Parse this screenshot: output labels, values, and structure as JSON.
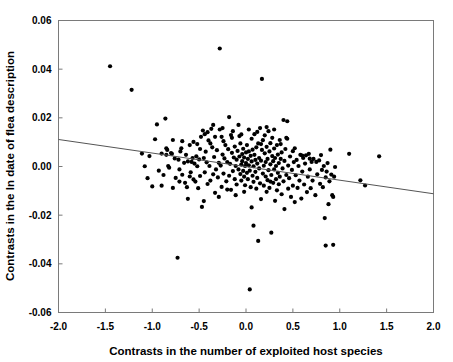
{
  "chart_data": {
    "type": "scatter",
    "title": "",
    "xlabel": "Contrasts in the number of exploited host species",
    "ylabel": "Contrasts in the ln date of flea description",
    "xlim": [
      -2.0,
      2.0
    ],
    "ylim": [
      -0.06,
      0.06
    ],
    "xticks": [
      -2.0,
      -1.5,
      -1.0,
      -0.5,
      0.0,
      0.5,
      1.0,
      1.5,
      2.0
    ],
    "yticks": [
      -0.06,
      -0.04,
      -0.02,
      0.0,
      0.02,
      0.04,
      0.06
    ],
    "xtick_labels": [
      "-2.0",
      "-1.5",
      "-1.0",
      "-0.5",
      "0.0",
      "0.5",
      "1.0",
      "1.5",
      "2.0"
    ],
    "ytick_labels": [
      "-0.06",
      "-0.04",
      "-0.02",
      "0.00",
      "0.02",
      "0.04",
      "0.06"
    ],
    "grid": false,
    "legend": false,
    "marker": "filled-circle",
    "marker_color": "#000000",
    "marker_size": 4.2,
    "frame_color": "#7a7a7a",
    "trendline": {
      "type": "linear",
      "color": "#555555",
      "x_start": -2.0,
      "y_start": 0.0111,
      "x_end": 2.0,
      "y_end": -0.0112,
      "slope": -0.005575,
      "intercept": -5e-05
    },
    "points": [
      [
        -1.45,
        0.0412
      ],
      [
        -1.22,
        0.0315
      ],
      [
        -1.11,
        0.0053
      ],
      [
        -1.08,
        0.0001
      ],
      [
        -1.05,
        -0.0048
      ],
      [
        -1.03,
        0.0043
      ],
      [
        -1.0,
        -0.0082
      ],
      [
        -0.97,
        0.0112
      ],
      [
        -0.95,
        0.0173
      ],
      [
        -0.93,
        -0.0017
      ],
      [
        -0.9,
        0.0053
      ],
      [
        -0.88,
        -0.0035
      ],
      [
        -0.86,
        0.0197
      ],
      [
        -0.85,
        0.0075
      ],
      [
        -0.84,
        0.0068
      ],
      [
        -0.83,
        0.0002
      ],
      [
        -0.82,
        -0.0005
      ],
      [
        -0.8,
        0.0055
      ],
      [
        -0.79,
        0.0052
      ],
      [
        -0.78,
        -0.0088
      ],
      [
        -0.76,
        0.0033
      ],
      [
        -0.75,
        -0.0047
      ],
      [
        -0.73,
        -0.0375
      ],
      [
        -0.72,
        0.0028
      ],
      [
        -0.71,
        -0.0012
      ],
      [
        -0.7,
        0.0062
      ],
      [
        -0.69,
        0.0075
      ],
      [
        -0.68,
        -0.0034
      ],
      [
        -0.66,
        0.0015
      ],
      [
        -0.65,
        -0.0067
      ],
      [
        -0.64,
        0.0048
      ],
      [
        -0.63,
        -0.0085
      ],
      [
        -0.62,
        0.0021
      ],
      [
        -0.6,
        0.0088
      ],
      [
        -0.59,
        -0.0024
      ],
      [
        -0.58,
        0.0019
      ],
      [
        -0.57,
        0.0035
      ],
      [
        -0.56,
        -0.0053
      ],
      [
        -0.55,
        0.0012
      ],
      [
        -0.54,
        -0.0062
      ],
      [
        -0.53,
        0.0042
      ],
      [
        -0.52,
        0.0001
      ],
      [
        -0.51,
        -0.0089
      ],
      [
        -0.5,
        0.0029
      ],
      [
        -0.49,
        -0.0039
      ],
      [
        -0.48,
        0.0122
      ],
      [
        -0.47,
        -0.0166
      ],
      [
        -0.46,
        0.0148
      ],
      [
        -0.45,
        0.0035
      ],
      [
        -0.44,
        -0.0024
      ],
      [
        -0.43,
        0.0061
      ],
      [
        -0.42,
        0.0017
      ],
      [
        -0.41,
        -0.0072
      ],
      [
        -0.4,
        0.0107
      ],
      [
        -0.39,
        0.0002
      ],
      [
        -0.38,
        -0.0058
      ],
      [
        -0.37,
        0.0155
      ],
      [
        -0.36,
        0.0079
      ],
      [
        -0.35,
        -0.0032
      ],
      [
        -0.34,
        0.0039
      ],
      [
        -0.33,
        0.0122
      ],
      [
        -0.32,
        -0.0012
      ],
      [
        -0.31,
        0.0067
      ],
      [
        -0.3,
        -0.0045
      ],
      [
        -0.29,
        0.0015
      ],
      [
        -0.28,
        0.0485
      ],
      [
        -0.28,
        0.0152
      ],
      [
        -0.27,
        0.0004
      ],
      [
        -0.26,
        -0.0084
      ],
      [
        -0.25,
        0.0158
      ],
      [
        -0.25,
        0.0049
      ],
      [
        -0.24,
        -0.0029
      ],
      [
        -0.23,
        0.0033
      ],
      [
        -0.22,
        0.0088
      ],
      [
        -0.21,
        -0.0061
      ],
      [
        -0.2,
        0.0018
      ],
      [
        -0.19,
        0.0071
      ],
      [
        -0.18,
        -0.0038
      ],
      [
        -0.18,
        0.0203
      ],
      [
        -0.17,
        0.0011
      ],
      [
        -0.16,
        -0.0096
      ],
      [
        -0.15,
        0.0056
      ],
      [
        -0.15,
        0.0118
      ],
      [
        -0.14,
        -0.0019
      ],
      [
        -0.13,
        0.0037
      ],
      [
        -0.12,
        0.0082
      ],
      [
        -0.12,
        -0.0052
      ],
      [
        -0.11,
        0.0002
      ],
      [
        -0.1,
        0.0028
      ],
      [
        -0.1,
        -0.0074
      ],
      [
        -0.09,
        0.0064
      ],
      [
        -0.08,
        -0.0012
      ],
      [
        -0.08,
        0.0171
      ],
      [
        -0.07,
        0.0041
      ],
      [
        -0.06,
        -0.0031
      ],
      [
        -0.06,
        0.0095
      ],
      [
        -0.05,
        0.0008
      ],
      [
        -0.05,
        -0.0058
      ],
      [
        -0.04,
        0.0051
      ],
      [
        -0.04,
        0.0022
      ],
      [
        -0.03,
        -0.0018
      ],
      [
        -0.03,
        0.0073
      ],
      [
        -0.02,
        -0.0042
      ],
      [
        -0.02,
        0.0037
      ],
      [
        -0.01,
        0.0002
      ],
      [
        -0.01,
        -0.0077
      ],
      [
        0.0,
        0.0058
      ],
      [
        0.0,
        0.0014
      ],
      [
        0.01,
        -0.0026
      ],
      [
        0.01,
        0.0088
      ],
      [
        0.02,
        0.0031
      ],
      [
        0.02,
        -0.0052
      ],
      [
        0.03,
        0.0005
      ],
      [
        0.03,
        0.0062
      ],
      [
        0.04,
        -0.0505
      ],
      [
        0.04,
        -0.0017
      ],
      [
        0.05,
        0.0044
      ],
      [
        0.05,
        -0.0085
      ],
      [
        0.06,
        0.0021
      ],
      [
        0.06,
        0.0114
      ],
      [
        0.07,
        -0.0038
      ],
      [
        0.07,
        0.0069
      ],
      [
        0.08,
        0.0001
      ],
      [
        0.08,
        -0.0063
      ],
      [
        0.09,
        0.0048
      ],
      [
        0.09,
        0.0133
      ],
      [
        0.1,
        -0.0022
      ],
      [
        0.1,
        0.0027
      ],
      [
        0.11,
        -0.0091
      ],
      [
        0.11,
        0.0079
      ],
      [
        0.12,
        0.0012
      ],
      [
        0.12,
        -0.0047
      ],
      [
        0.13,
        0.0095
      ],
      [
        0.13,
        -0.0306
      ],
      [
        0.14,
        0.0035
      ],
      [
        0.14,
        -0.0008
      ],
      [
        0.15,
        -0.0069
      ],
      [
        0.15,
        0.0158
      ],
      [
        0.16,
        0.0024
      ],
      [
        0.16,
        -0.0134
      ],
      [
        0.17,
        0.036
      ],
      [
        0.17,
        0.0068
      ],
      [
        0.18,
        -0.0029
      ],
      [
        0.18,
        0.0108
      ],
      [
        0.19,
        0.0003
      ],
      [
        0.19,
        -0.0079
      ],
      [
        0.2,
        0.0054
      ],
      [
        0.2,
        0.0128
      ],
      [
        0.21,
        -0.0041
      ],
      [
        0.21,
        0.0018
      ],
      [
        0.22,
        -0.0104
      ],
      [
        0.22,
        0.0081
      ],
      [
        0.23,
        0.0031
      ],
      [
        0.23,
        -0.0056
      ],
      [
        0.24,
        0.0145
      ],
      [
        0.24,
        -0.0015
      ],
      [
        0.25,
        0.0062
      ],
      [
        0.25,
        -0.0088
      ],
      [
        0.26,
        0.0009
      ],
      [
        0.26,
        0.0096
      ],
      [
        0.27,
        -0.0035
      ],
      [
        0.27,
        -0.0272
      ],
      [
        0.28,
        0.0043
      ],
      [
        0.28,
        0.0118
      ],
      [
        0.29,
        -0.0067
      ],
      [
        0.29,
        0.0022
      ],
      [
        0.3,
        -0.0012
      ],
      [
        0.3,
        0.0074
      ],
      [
        0.31,
        -0.0141
      ],
      [
        0.31,
        0.0035
      ],
      [
        0.32,
        0.0002
      ],
      [
        0.32,
        -0.0052
      ],
      [
        0.33,
        0.0088
      ],
      [
        0.33,
        -0.0098
      ],
      [
        0.34,
        0.0049
      ],
      [
        0.34,
        -0.0026
      ],
      [
        0.35,
        0.0014
      ],
      [
        0.35,
        -0.0073
      ],
      [
        0.36,
        0.0109
      ],
      [
        0.36,
        -0.0042
      ],
      [
        0.37,
        0.0031
      ],
      [
        0.38,
        -0.0114
      ],
      [
        0.38,
        0.0058
      ],
      [
        0.39,
        -0.0008
      ],
      [
        0.4,
        0.0191
      ],
      [
        0.4,
        -0.0061
      ],
      [
        0.41,
        0.0023
      ],
      [
        0.41,
        -0.0175
      ],
      [
        0.42,
        0.0072
      ],
      [
        0.43,
        -0.0035
      ],
      [
        0.43,
        0.0118
      ],
      [
        0.44,
        0.0186
      ],
      [
        0.45,
        -0.0091
      ],
      [
        0.45,
        0.0004
      ],
      [
        0.46,
        -0.0048
      ],
      [
        0.47,
        0.0041
      ],
      [
        0.48,
        -0.0125
      ],
      [
        0.49,
        -0.0014
      ],
      [
        0.5,
        0.0063
      ],
      [
        0.5,
        -0.0079
      ],
      [
        0.51,
        0.0018
      ],
      [
        0.52,
        -0.0146
      ],
      [
        0.53,
        -0.0036
      ],
      [
        0.54,
        0.0027
      ],
      [
        0.55,
        -0.0088
      ],
      [
        0.56,
        0.0002
      ],
      [
        0.57,
        -0.0058
      ],
      [
        0.58,
        0.0048
      ],
      [
        0.59,
        -0.0132
      ],
      [
        0.6,
        -0.0021
      ],
      [
        0.61,
        0.0035
      ],
      [
        0.62,
        -0.0074
      ],
      [
        0.63,
        0.0012
      ],
      [
        0.64,
        0.0046
      ],
      [
        0.65,
        -0.0105
      ],
      [
        0.66,
        -0.0042
      ],
      [
        0.67,
        0.0052
      ],
      [
        0.68,
        -0.0012
      ],
      [
        0.69,
        -0.0089
      ],
      [
        0.7,
        0.0019
      ],
      [
        0.71,
        -0.0058
      ],
      [
        0.72,
        0.0031
      ],
      [
        0.74,
        -0.0118
      ],
      [
        0.76,
        -0.0032
      ],
      [
        0.78,
        0.0025
      ],
      [
        0.79,
        -0.0071
      ],
      [
        0.8,
        0.0047
      ],
      [
        0.81,
        -0.0014
      ],
      [
        0.82,
        -0.0085
      ],
      [
        0.83,
        0.0002
      ],
      [
        0.84,
        -0.0212
      ],
      [
        0.85,
        -0.0045
      ],
      [
        0.85,
        -0.0325
      ],
      [
        0.86,
        -0.0021
      ],
      [
        0.87,
        0.0014
      ],
      [
        0.88,
        -0.0155
      ],
      [
        0.89,
        -0.0061
      ],
      [
        0.9,
        0.0069
      ],
      [
        0.91,
        -0.0033
      ],
      [
        0.92,
        -0.0118
      ],
      [
        0.93,
        -0.0322
      ],
      [
        0.93,
        -0.0125
      ],
      [
        0.94,
        -0.0042
      ],
      [
        0.95,
        -0.0002
      ],
      [
        1.1,
        0.0052
      ],
      [
        1.22,
        -0.0057
      ],
      [
        1.27,
        -0.0078
      ],
      [
        1.42,
        0.0042
      ],
      [
        -0.71,
        -0.0062
      ],
      [
        -0.62,
        -0.0133
      ],
      [
        -0.56,
        0.0101
      ],
      [
        -0.49,
        0.0072
      ],
      [
        -0.44,
        0.0133
      ],
      [
        -0.38,
        0.0095
      ],
      [
        -0.33,
        -0.0108
      ],
      [
        -0.29,
        -0.0125
      ],
      [
        -0.24,
        0.0104
      ],
      [
        -0.2,
        -0.0095
      ],
      [
        -0.16,
        0.0129
      ],
      [
        -0.11,
        -0.0118
      ],
      [
        -0.07,
        0.0125
      ],
      [
        -0.02,
        -0.0104
      ],
      [
        0.03,
        0.0152
      ],
      [
        0.08,
        -0.0243
      ],
      [
        0.12,
        0.0142
      ],
      [
        0.22,
        0.0162
      ],
      [
        0.3,
        0.0152
      ],
      [
        0.37,
        0.0092
      ],
      [
        -0.9,
        -0.0079
      ],
      [
        -0.85,
        0.0048
      ],
      [
        -0.78,
        0.0109
      ],
      [
        -0.68,
        0.0104
      ],
      [
        -0.6,
        -0.0041
      ],
      [
        -0.52,
        0.0092
      ],
      [
        -0.45,
        -0.0142
      ],
      [
        -0.41,
        0.0141
      ],
      [
        -0.35,
        0.0171
      ],
      [
        -0.26,
        0.0122
      ],
      [
        -0.14,
        0.0145
      ],
      [
        -0.05,
        0.0132
      ],
      [
        0.06,
        -0.0168
      ],
      [
        0.16,
        0.0092
      ],
      [
        0.26,
        -0.0062
      ],
      [
        0.44,
        0.0114
      ],
      [
        0.52,
        0.0075
      ],
      [
        0.6,
        0.0045
      ],
      [
        0.68,
        0.0032
      ],
      [
        0.75,
        0.0019
      ]
    ]
  }
}
